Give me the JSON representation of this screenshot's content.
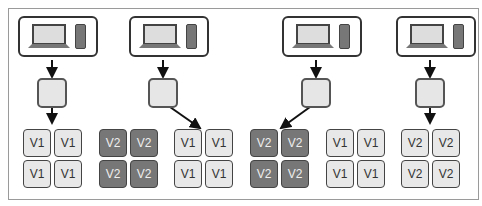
{
  "diagram": {
    "type": "blue-green-deployment",
    "stages": [
      {
        "pool_a": "V1",
        "pool_b": null,
        "target": "a"
      },
      {
        "pool_a": "V2",
        "pool_b": "V1",
        "target": "b"
      },
      {
        "pool_a": "V2",
        "pool_b": "V1",
        "target": "a"
      },
      {
        "pool_a": "V2",
        "pool_b": null,
        "target": "a"
      }
    ],
    "labels": {
      "v1": "V1",
      "v2": "V2"
    },
    "icons": {
      "client": "laptop-and-phone-icon",
      "router": "load-balancer-icon"
    },
    "colors": {
      "old": "#e8e8e8",
      "new": "#777777",
      "border": "#333333"
    }
  }
}
